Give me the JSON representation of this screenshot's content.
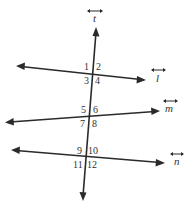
{
  "diagram": {
    "type": "parallel lines cut by a transversal",
    "colors": {
      "line": "#2a2a2a",
      "text": "#333333",
      "background": "#ffffff"
    },
    "transversal": {
      "name": "t",
      "symbol": "line-arrow-icon"
    },
    "lines": [
      {
        "name": "l",
        "symbol": "line-arrow-icon",
        "angles": [
          "1",
          "2",
          "3",
          "4"
        ]
      },
      {
        "name": "m",
        "symbol": "line-arrow-icon",
        "angles": [
          "5",
          "6",
          "7",
          "8"
        ]
      },
      {
        "name": "n",
        "symbol": "line-arrow-icon",
        "angles": [
          "9",
          "10",
          "11",
          "12"
        ]
      }
    ]
  }
}
